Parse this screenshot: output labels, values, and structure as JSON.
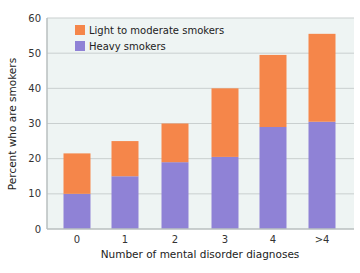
{
  "chart_data": {
    "type": "bar",
    "stacked": true,
    "title": "",
    "xlabel": "Number of mental disorder diagnoses",
    "ylabel": "Percent who are smokers",
    "categories": [
      "0",
      "1",
      "2",
      "3",
      "4",
      ">4"
    ],
    "ylim": [
      0,
      60
    ],
    "yticks": [
      0,
      10,
      20,
      30,
      40,
      50,
      60
    ],
    "grid": true,
    "legend_position": "top-left",
    "series": [
      {
        "name": "Heavy smokers",
        "color": "#8f82d6",
        "values": [
          10,
          15,
          19,
          20.5,
          29,
          30.5
        ]
      },
      {
        "name": "Light to moderate smokers",
        "color": "#f5864a",
        "values": [
          11.5,
          10,
          11,
          19.5,
          20.5,
          25
        ]
      }
    ],
    "totals": [
      21.5,
      25,
      30,
      40,
      49.5,
      55.5
    ]
  },
  "legend": {
    "items": [
      {
        "label": "Light to moderate smokers",
        "color": "#f5864a"
      },
      {
        "label": "Heavy smokers",
        "color": "#8f82d6"
      }
    ]
  },
  "colors": {
    "plot_background": "#eef4f3",
    "grid": "#c9cfcf",
    "axis": "#b9bfbf"
  }
}
